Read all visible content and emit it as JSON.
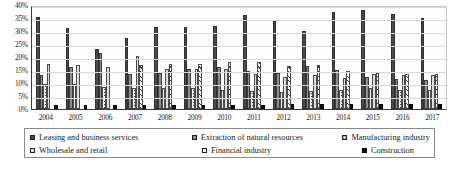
{
  "chart_data": {
    "type": "bar",
    "title": "",
    "xlabel": "",
    "ylabel": "",
    "ylim": [
      0,
      40
    ],
    "grid": true,
    "legend_position": "bottom",
    "categories": [
      "2004",
      "2005",
      "2006",
      "2007",
      "2008",
      "2009",
      "2010",
      "2011",
      "2012",
      "2013",
      "2014",
      "2015",
      "2016",
      "2017"
    ],
    "y_ticks": [
      "0%",
      "5%",
      "10%",
      "15%",
      "20%",
      "25%",
      "30%",
      "35%",
      "40%"
    ],
    "y_tick_values": [
      0,
      5,
      10,
      15,
      20,
      25,
      30,
      35,
      40
    ],
    "series": [
      {
        "name": "Leasing and business services",
        "color": "#4b4b4b",
        "pattern": "solid-dark",
        "values": [
          35.5,
          31.0,
          23.0,
          27.5,
          31.5,
          31.5,
          32.0,
          36.0,
          34.0,
          30.0,
          37.5,
          38.0,
          36.5,
          35.0
        ]
      },
      {
        "name": "Extraction of natural resources",
        "color": "#8e8e8e",
        "pattern": "solid-gray",
        "values": [
          13.0,
          16.0,
          21.5,
          13.5,
          14.0,
          15.5,
          16.0,
          14.5,
          14.0,
          16.5,
          15.0,
          12.5,
          11.5,
          11.0
        ]
      },
      {
        "name": "Manufacturing industry",
        "color": "#f4f4f4",
        "pattern": "dotted",
        "values": [
          9.5,
          9.5,
          8.5,
          8.0,
          8.0,
          8.0,
          7.5,
          7.0,
          6.5,
          7.0,
          7.5,
          8.0,
          7.5,
          7.5
        ]
      },
      {
        "name": "Wholesale and retail",
        "color": "#dedede",
        "pattern": "light-solid",
        "values": [
          17.5,
          17.0,
          16.0,
          20.5,
          15.5,
          15.5,
          15.5,
          13.5,
          12.5,
          13.0,
          12.0,
          13.5,
          13.0,
          13.0
        ]
      },
      {
        "name": "Financial industry",
        "color": "#fbfbfb",
        "pattern": "diagonal-hatch",
        "values": [
          0.0,
          0.0,
          0.0,
          17.0,
          17.5,
          17.5,
          18.0,
          18.0,
          16.5,
          17.0,
          14.5,
          14.0,
          13.5,
          13.5
        ]
      },
      {
        "name": "Construction",
        "color": "#121212",
        "pattern": "solid-black",
        "values": [
          1.5,
          1.5,
          1.5,
          1.5,
          1.5,
          1.5,
          1.5,
          1.5,
          2.0,
          2.0,
          2.0,
          2.0,
          2.0,
          2.0
        ]
      }
    ]
  },
  "legend": {
    "items": [
      {
        "label": "Leasing and business services"
      },
      {
        "label": "Extraction of natural resources"
      },
      {
        "label": "Manufacturing industry"
      },
      {
        "label": "Wholesale and retail"
      },
      {
        "label": "Financial industry"
      },
      {
        "label": "Construction"
      }
    ]
  }
}
